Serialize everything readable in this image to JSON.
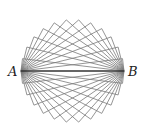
{
  "diagram": {
    "point_a": {
      "label": "A",
      "x": 21,
      "y": 71
    },
    "point_b": {
      "label": "B",
      "x": 124,
      "y": 71
    },
    "center": {
      "x": 72.5,
      "y": 71
    },
    "radius": 51.5,
    "rectangle_count": 12,
    "angle_step_divisor": 13,
    "colors": {
      "edges": "#7a7a7a",
      "diagonal": "#333333",
      "labels": "#222222",
      "background": "#ffffff"
    }
  }
}
